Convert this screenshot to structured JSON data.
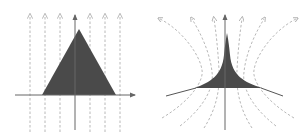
{
  "figure": {
    "panels": [
      {
        "id": "left",
        "description": "triangle with parallel vertical dashed field lines",
        "shape": "triangle",
        "field_lines": "parallel-vertical-dashed",
        "field_line_count": 7
      },
      {
        "id": "right",
        "description": "concave cusp with curved diverging dashed field lines",
        "shape": "cusp",
        "field_lines": "curved-diverging-dashed",
        "field_line_count": 6
      }
    ],
    "colors": {
      "fill": "#4a4a4a",
      "axis": "#666666",
      "field_line": "#b0b0b0",
      "background": "#ffffff"
    }
  }
}
